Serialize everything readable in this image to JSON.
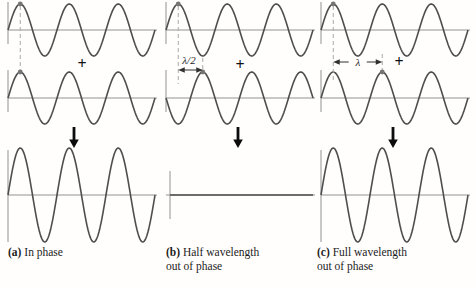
{
  "labels": {
    "plus": "+",
    "lambda_half": "λ/2",
    "lambda": "λ"
  },
  "captions": {
    "a": {
      "tag": "(a)",
      "line1": "In phase",
      "line2": ""
    },
    "b": {
      "tag": "(b)",
      "line1": "Half wavelength",
      "line2": "out of phase"
    },
    "c": {
      "tag": "(c)",
      "line1": "Full wavelength",
      "line2": "out of phase"
    }
  },
  "colors": {
    "wave": "#4e4e4e",
    "axis": "#929292",
    "dashed": "#a8a8a8",
    "dot": "#757575",
    "measure": "#303030",
    "arrow": "#0c0c0c",
    "text": "#1c1c1c",
    "background": "#fffefd"
  },
  "chart_data": {
    "type": "line",
    "wavelength_px": 49,
    "cycles_shown": 3,
    "input_amplitude": 1,
    "panels": [
      {
        "id": "a",
        "caption": "(a) In phase",
        "wave1_shift_wavelengths": 0,
        "wave2_shift_wavelengths": 0,
        "result_amplitude_factor": 2,
        "annotation": null,
        "result": "constructive interference: double amplitude"
      },
      {
        "id": "b",
        "caption": "(b) Half wavelength out of phase",
        "wave1_shift_wavelengths": 0,
        "wave2_shift_wavelengths": 0.5,
        "result_amplitude_factor": 0,
        "annotation": "λ/2",
        "result": "destructive interference: zero amplitude (flat line)"
      },
      {
        "id": "c",
        "caption": "(c) Full wavelength out of phase",
        "wave1_shift_wavelengths": 0,
        "wave2_shift_wavelengths": 1,
        "result_amplitude_factor": 2,
        "annotation": "λ",
        "result": "constructive interference: double amplitude"
      }
    ]
  }
}
